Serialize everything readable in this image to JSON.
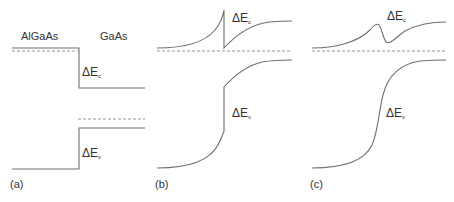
{
  "figure": {
    "panel_a": {
      "label": "(a)",
      "left_material": "AlGaAs",
      "right_material": "GaAs",
      "delta_ec": {
        "symbol": "ΔE",
        "sub": "c"
      },
      "delta_ev": {
        "symbol": "ΔE",
        "sub": "v"
      }
    },
    "panel_b": {
      "label": "(b)",
      "delta_ec": {
        "symbol": "ΔE",
        "sub": "c"
      },
      "delta_ev": {
        "symbol": "ΔE",
        "sub": "v"
      }
    },
    "panel_c": {
      "label": "(c)",
      "delta_ec": {
        "symbol": "ΔE",
        "sub": "c"
      },
      "delta_ev": {
        "symbol": "ΔE",
        "sub": "v"
      }
    },
    "colors": {
      "line": "#6e6e6e",
      "dash": "#8a8a8a",
      "text": "#333333"
    }
  }
}
